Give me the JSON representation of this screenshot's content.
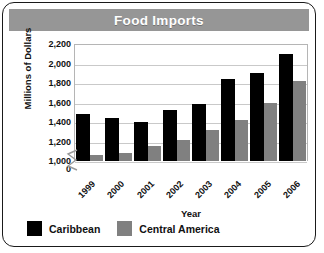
{
  "chart_data": {
    "type": "bar",
    "title": "Food Imports",
    "xlabel": "Year",
    "ylabel": "Millions of Dollars",
    "categories": [
      "1999",
      "2000",
      "2001",
      "2002",
      "2003",
      "2004",
      "2005",
      "2006"
    ],
    "series": [
      {
        "name": "Caribbean",
        "color": "#000000",
        "values": [
          1480,
          1440,
          1400,
          1520,
          1580,
          1840,
          1900,
          2100
        ]
      },
      {
        "name": "Central America",
        "color": "#808080",
        "values": [
          1060,
          1080,
          1150,
          1220,
          1320,
          1420,
          1590,
          1820
        ]
      }
    ],
    "ylim": [
      1000,
      2200
    ],
    "yticks": [
      "2,200",
      "2,000",
      "1,800",
      "1,600",
      "1,400",
      "1,200",
      "1,000",
      "0"
    ],
    "ytick_values": [
      2200,
      2000,
      1800,
      1600,
      1400,
      1200,
      1000,
      0
    ],
    "axis_break": true,
    "grid": true,
    "legend_position": "bottom-left"
  },
  "legend": {
    "items": [
      {
        "label": "Caribbean",
        "color": "#000000"
      },
      {
        "label": "Central America",
        "color": "#808080"
      }
    ]
  }
}
